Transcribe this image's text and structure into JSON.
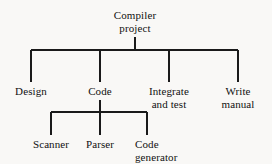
{
  "diagram": {
    "type": "tree",
    "background_color": "#f9f8f6",
    "line_color": "#1a1a1a",
    "text_color": "#111111",
    "root": {
      "id": "compiler-project",
      "label_lines": [
        "Compiler",
        "project"
      ],
      "label": "Compiler project",
      "level": 0
    },
    "level1": [
      {
        "id": "design",
        "label_lines": [
          "Design"
        ],
        "label": "Design",
        "level": 1
      },
      {
        "id": "code",
        "label_lines": [
          "Code"
        ],
        "label": "Code",
        "level": 1
      },
      {
        "id": "integrate-and-test",
        "label_lines": [
          "Integrate",
          "and test"
        ],
        "label": "Integrate and test",
        "level": 1
      },
      {
        "id": "write-manual",
        "label_lines": [
          "Write",
          "manual"
        ],
        "label": "Write manual",
        "level": 1
      }
    ],
    "level2": [
      {
        "id": "scanner",
        "label_lines": [
          "Scanner"
        ],
        "label": "Scanner",
        "level": 2,
        "parent": "code"
      },
      {
        "id": "parser",
        "label_lines": [
          "Parser"
        ],
        "label": "Parser",
        "level": 2,
        "parent": "code"
      },
      {
        "id": "code-generator",
        "label_lines": [
          "Code",
          "generator"
        ],
        "label": "Code generator",
        "level": 2,
        "parent": "code"
      }
    ],
    "edges": [
      {
        "from": "compiler-project",
        "to": "design"
      },
      {
        "from": "compiler-project",
        "to": "code"
      },
      {
        "from": "compiler-project",
        "to": "integrate-and-test"
      },
      {
        "from": "compiler-project",
        "to": "write-manual"
      },
      {
        "from": "code",
        "to": "scanner"
      },
      {
        "from": "code",
        "to": "parser"
      },
      {
        "from": "code",
        "to": "code-generator"
      }
    ]
  }
}
